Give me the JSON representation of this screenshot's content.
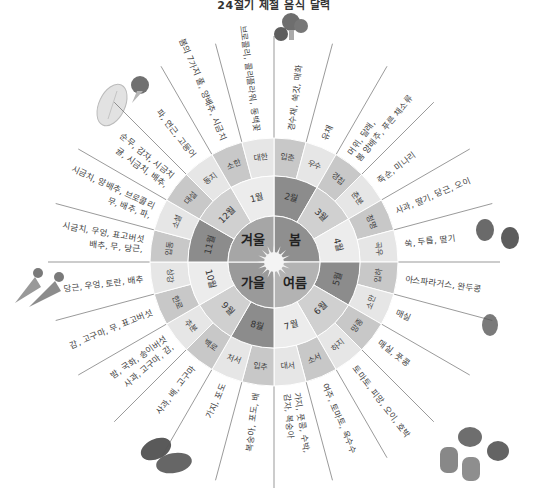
{
  "title": "24절기 제철 음식 달력",
  "center": {
    "icon": "sun-icon"
  },
  "seasons": [
    {
      "label": "봄",
      "quadrant": "upper-right",
      "color": "#8f8f8f"
    },
    {
      "label": "여름",
      "quadrant": "lower-right",
      "color": "#b3b3b3"
    },
    {
      "label": "가을",
      "quadrant": "lower-left",
      "color": "#9a9a9a"
    },
    {
      "label": "겨울",
      "quadrant": "upper-left",
      "color": "#a6a6a6"
    }
  ],
  "months": [
    {
      "label": "2월"
    },
    {
      "label": "3월"
    },
    {
      "label": "4월"
    },
    {
      "label": "5월"
    },
    {
      "label": "6월"
    },
    {
      "label": "7월"
    },
    {
      "label": "8월"
    },
    {
      "label": "9월"
    },
    {
      "label": "10월"
    },
    {
      "label": "11월"
    },
    {
      "label": "12월"
    },
    {
      "label": "1월"
    }
  ],
  "solar_terms": [
    {
      "term": "입춘",
      "foods": "경수채, 쑥갓, 매화"
    },
    {
      "term": "우수",
      "foods": "유채"
    },
    {
      "term": "경칩",
      "foods": "머위, 달래, 봄 양배추, 푸른 채소류"
    },
    {
      "term": "춘분",
      "foods": "죽순, 미나리"
    },
    {
      "term": "청명",
      "foods": "사과, 딸기, 당근, 오이"
    },
    {
      "term": "곡우",
      "foods": "쑥, 두릅, 딸기"
    },
    {
      "term": "입하",
      "foods": "아스파라거스, 완두콩"
    },
    {
      "term": "소만",
      "foods": "매실"
    },
    {
      "term": "망종",
      "foods": "매실, 풋콩"
    },
    {
      "term": "하지",
      "foods": "토마토, 피망, 오이, 호박"
    },
    {
      "term": "소서",
      "foods": "여주, 토마토, 옥수수"
    },
    {
      "term": "대서",
      "foods": "가지, 풋콩, 수박, 감자, 복숭아"
    },
    {
      "term": "입추",
      "foods": "복숭아, 포도, 배"
    },
    {
      "term": "처서",
      "foods": "가지, 포도"
    },
    {
      "term": "백로",
      "foods": "사과, 배, 고구마"
    },
    {
      "term": "추분",
      "foods": "사과, 고구마, 감, 밤, 국화, 송이버섯"
    },
    {
      "term": "한로",
      "foods": "감, 고구마, 무, 표고버섯"
    },
    {
      "term": "상강",
      "foods": "당근, 우엉, 토란, 배추"
    },
    {
      "term": "입동",
      "foods": "배추, 무, 당근, 시금치, 우엉, 표고버섯"
    },
    {
      "term": "소설",
      "foods": "무, 배추, 파, 시금치, 양배추, 브로콜리"
    },
    {
      "term": "대설",
      "foods": "귤, 시금치, 배추, 순무, 감자, 시금치"
    },
    {
      "term": "동지",
      "foods": "파, 연근, 고등어"
    },
    {
      "term": "소한",
      "foods": "봄의 7가지 풀, 양배추, 시금치"
    },
    {
      "term": "대한",
      "foods": "브로콜리, 콜리플라워, 동백꽃"
    }
  ],
  "illustrations": [
    {
      "name": "broccoli-icon",
      "x": 291,
      "y": 28
    },
    {
      "name": "napa-cabbage-icon",
      "x": 112,
      "y": 105
    },
    {
      "name": "broccoli-small-icon",
      "x": 140,
      "y": 85
    },
    {
      "name": "strawberry-icon",
      "x": 500,
      "y": 237
    },
    {
      "name": "carrot-icon",
      "x": 35,
      "y": 285
    },
    {
      "name": "radish-icon",
      "x": 490,
      "y": 325
    },
    {
      "name": "eggplant-icon",
      "x": 170,
      "y": 455
    },
    {
      "name": "tomato-pepper-icon",
      "x": 480,
      "y": 455
    }
  ],
  "colors": {
    "shade_dark": "#9e9e9e",
    "shade_mid": "#c8c8c8",
    "shade_light": "#e6e6e6",
    "line": "#555555"
  }
}
